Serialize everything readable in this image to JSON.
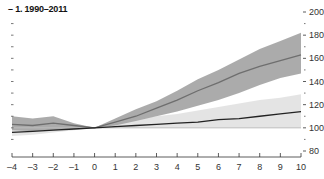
{
  "chart_data": {
    "type": "line",
    "title": "1. 1990–2011",
    "title_prefix": "–",
    "xlabel": "",
    "ylabel": "",
    "x": [
      -4,
      -3,
      -2,
      -1,
      0,
      1,
      2,
      3,
      4,
      5,
      6,
      7,
      8,
      9,
      10
    ],
    "x_tick_labels": [
      "–4",
      "–3",
      "–2",
      "–1",
      "0",
      "1",
      "2",
      "3",
      "4",
      "5",
      "6",
      "7",
      "8",
      "9",
      "10"
    ],
    "xlim": [
      -4,
      10
    ],
    "ylim": [
      80,
      200
    ],
    "y_ticks": [
      80,
      100,
      120,
      140,
      160,
      180,
      200
    ],
    "y_axis_position": "right",
    "grid": false,
    "reference_line": 100,
    "series": [
      {
        "name": "upper series (median)",
        "color": "#6e6e6e",
        "values": [
          103,
          102,
          104,
          102,
          100,
          105,
          110,
          117,
          124,
          132,
          139,
          147,
          153,
          158,
          163
        ],
        "band_lower": [
          98,
          97,
          98,
          99,
          100,
          102,
          106,
          110,
          114,
          119,
          124,
          130,
          137,
          143,
          147
        ],
        "band_upper": [
          110,
          108,
          110,
          104,
          100,
          108,
          116,
          123,
          132,
          142,
          150,
          159,
          168,
          175,
          182
        ],
        "band_color": "#a6a6a6"
      },
      {
        "name": "lower series (median)",
        "color": "#222222",
        "values": [
          96,
          97,
          98,
          99,
          100,
          101,
          102,
          103,
          104,
          105,
          107,
          108,
          110,
          112,
          114
        ],
        "band_lower": [
          93,
          94,
          96,
          98,
          100,
          100,
          100,
          100,
          100,
          100,
          100,
          100,
          100,
          100,
          100
        ],
        "band_upper": [
          101,
          101,
          101,
          100,
          100,
          104,
          107,
          110,
          112,
          115,
          118,
          121,
          124,
          126,
          129
        ],
        "band_color": "#e3e3e3"
      }
    ]
  }
}
